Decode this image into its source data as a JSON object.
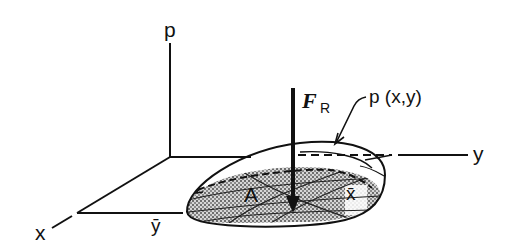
{
  "figure": {
    "axes": {
      "p_label": "p",
      "x_label": "x",
      "y_label": "y"
    },
    "force": {
      "symbol": "F",
      "subscript": "R"
    },
    "load_function_label": "p (x,y)",
    "area_label": "A",
    "centroid": {
      "x_bar_label": "x̄",
      "y_bar_label": "ȳ"
    },
    "colors": {
      "ink": "#111111",
      "background": "#ffffff",
      "shading": "#9a9a9a"
    }
  }
}
